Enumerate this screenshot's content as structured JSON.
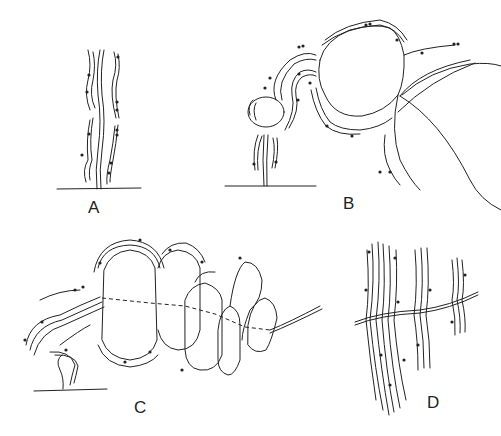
{
  "figure": {
    "panels": [
      {
        "id": "A",
        "label": "A",
        "description": "Single upright stalk with wavy parallel filaments bearing dark dots, rising from a baseline"
      },
      {
        "id": "B",
        "label": "B",
        "description": "Stalk with small vesicle and large round vesicles wrapped by sheaths bearing dark dots"
      },
      {
        "id": "C",
        "label": "C",
        "description": "Chain of lobed compartments connected by dashed double-arrow line, sheathed on the left, ending in a thread"
      },
      {
        "id": "D",
        "label": "D",
        "description": "Bundles of vertical wavy filaments crossed by a horizontal thread"
      }
    ]
  }
}
